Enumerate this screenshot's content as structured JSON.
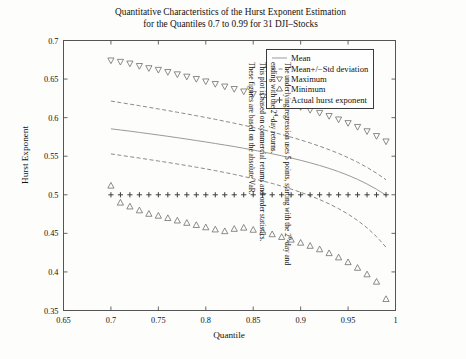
{
  "figure": {
    "title_line1": "Quantitative Characteristics of the Hurst Exponent Estimation",
    "title_line2": "for the Quantiles 0.7 to 0.99 for 31 DJI–Stocks"
  },
  "axes": {
    "xlabel": "Quantile",
    "ylabel": "Hurst Exponent",
    "xticks": [
      "0.65",
      "0.7",
      "0.75",
      "0.8",
      "0.85",
      "0.9",
      "0.95",
      "1"
    ],
    "yticks": [
      "0.35",
      "0.4",
      "0.45",
      "0.5",
      "0.55",
      "0.6",
      "0.65",
      "0.7"
    ]
  },
  "legend": {
    "items": [
      {
        "label": "Mean",
        "symbol": "solid-line"
      },
      {
        "label": "Mean+/−Std deviation",
        "symbol": "dashed-line"
      },
      {
        "label": "Maximum",
        "symbol": "down-triangle-marker"
      },
      {
        "label": "Minimum",
        "symbol": "up-triangle-marker"
      },
      {
        "label": "Actual hurst exponent",
        "symbol": "plus-marker"
      }
    ]
  },
  "caption": {
    "line1_pre": "The underlying regression uses 5 points, starting with the 2",
    "line1_sup": "0",
    "line1_post": "-day and",
    "line2_pre": "ending with the 2",
    "line2_sup": "4",
    "line2_post": "-day returns.",
    "line3": "This plot is based on commercial returns and order statistics.",
    "line4": "These figures are based on the absolute VaR."
  },
  "colors": {
    "frame": "#555555",
    "mean_line": "#9a9a9a",
    "std_line": "#8a8a8a",
    "marker": "#6e6e6e",
    "background": "#fdfdfb"
  },
  "chart_data": {
    "type": "line",
    "xlabel": "Quantile",
    "ylabel": "Hurst Exponent",
    "xlim": [
      0.65,
      1.0
    ],
    "ylim": [
      0.35,
      0.7
    ],
    "grid": false,
    "legend_position": "top-right-inside",
    "x": [
      0.7,
      0.71,
      0.72,
      0.73,
      0.74,
      0.75,
      0.76,
      0.77,
      0.78,
      0.79,
      0.8,
      0.81,
      0.82,
      0.83,
      0.84,
      0.85,
      0.86,
      0.87,
      0.88,
      0.89,
      0.9,
      0.91,
      0.92,
      0.93,
      0.94,
      0.95,
      0.96,
      0.97,
      0.98,
      0.99
    ],
    "series": [
      {
        "name": "Mean",
        "style": "solid",
        "values": [
          0.5855,
          0.584,
          0.5825,
          0.5808,
          0.5792,
          0.5775,
          0.5758,
          0.574,
          0.5722,
          0.5703,
          0.5685,
          0.5665,
          0.5645,
          0.5625,
          0.5603,
          0.558,
          0.5556,
          0.5531,
          0.5505,
          0.5477,
          0.5447,
          0.5415,
          0.538,
          0.5342,
          0.53,
          0.5253,
          0.52,
          0.514,
          0.5072,
          0.4995
        ]
      },
      {
        "name": "Mean+Std deviation",
        "style": "dashed",
        "values": [
          0.6215,
          0.6195,
          0.6175,
          0.6155,
          0.6134,
          0.6113,
          0.6092,
          0.607,
          0.6048,
          0.6025,
          0.6002,
          0.5978,
          0.5953,
          0.5928,
          0.5901,
          0.5873,
          0.5844,
          0.5813,
          0.5781,
          0.5747,
          0.5711,
          0.5672,
          0.563,
          0.5585,
          0.5536,
          0.5482,
          0.5422,
          0.5355,
          0.528,
          0.5195
        ]
      },
      {
        "name": "Mean-Std deviation",
        "style": "dashed",
        "values": [
          0.553,
          0.5512,
          0.5494,
          0.5476,
          0.5457,
          0.5438,
          0.5419,
          0.5399,
          0.5379,
          0.5358,
          0.5336,
          0.5313,
          0.5289,
          0.5264,
          0.5237,
          0.5209,
          0.5179,
          0.5147,
          0.5112,
          0.5074,
          0.5033,
          0.4988,
          0.4938,
          0.4883,
          0.482,
          0.475,
          0.4668,
          0.4572,
          0.4458,
          0.432
        ]
      },
      {
        "name": "Maximum",
        "style": "markers",
        "marker": "down-triangle",
        "values": [
          0.674,
          0.6722,
          0.67,
          0.6668,
          0.664,
          0.6618,
          0.659,
          0.656,
          0.653,
          0.65,
          0.6468,
          0.6435,
          0.6402,
          0.637,
          0.6338,
          0.6305,
          0.6272,
          0.624,
          0.6205,
          0.617,
          0.6135,
          0.6098,
          0.606,
          0.602,
          0.5975,
          0.5928,
          0.5878,
          0.5822,
          0.576,
          0.569
        ]
      },
      {
        "name": "Minimum",
        "style": "markers",
        "marker": "up-triangle",
        "values": [
          0.512,
          0.49,
          0.485,
          0.48,
          0.4755,
          0.473,
          0.47,
          0.4668,
          0.4638,
          0.461,
          0.458,
          0.4552,
          0.453,
          0.456,
          0.4575,
          0.4548,
          0.452,
          0.449,
          0.4455,
          0.442,
          0.438,
          0.434,
          0.4295,
          0.4245,
          0.419,
          0.4128,
          0.4055,
          0.397,
          0.3875,
          0.365
        ]
      },
      {
        "name": "Actual hurst exponent",
        "style": "markers",
        "marker": "plus",
        "values": [
          0.5,
          0.5,
          0.5,
          0.5,
          0.5,
          0.5,
          0.5,
          0.5,
          0.5,
          0.5,
          0.5,
          0.5,
          0.5,
          0.5,
          0.5,
          0.5,
          0.5,
          0.5,
          0.5,
          0.5,
          0.5,
          0.5,
          0.5,
          0.5,
          0.5,
          0.5,
          0.5,
          0.5,
          0.5,
          0.5
        ]
      }
    ]
  }
}
